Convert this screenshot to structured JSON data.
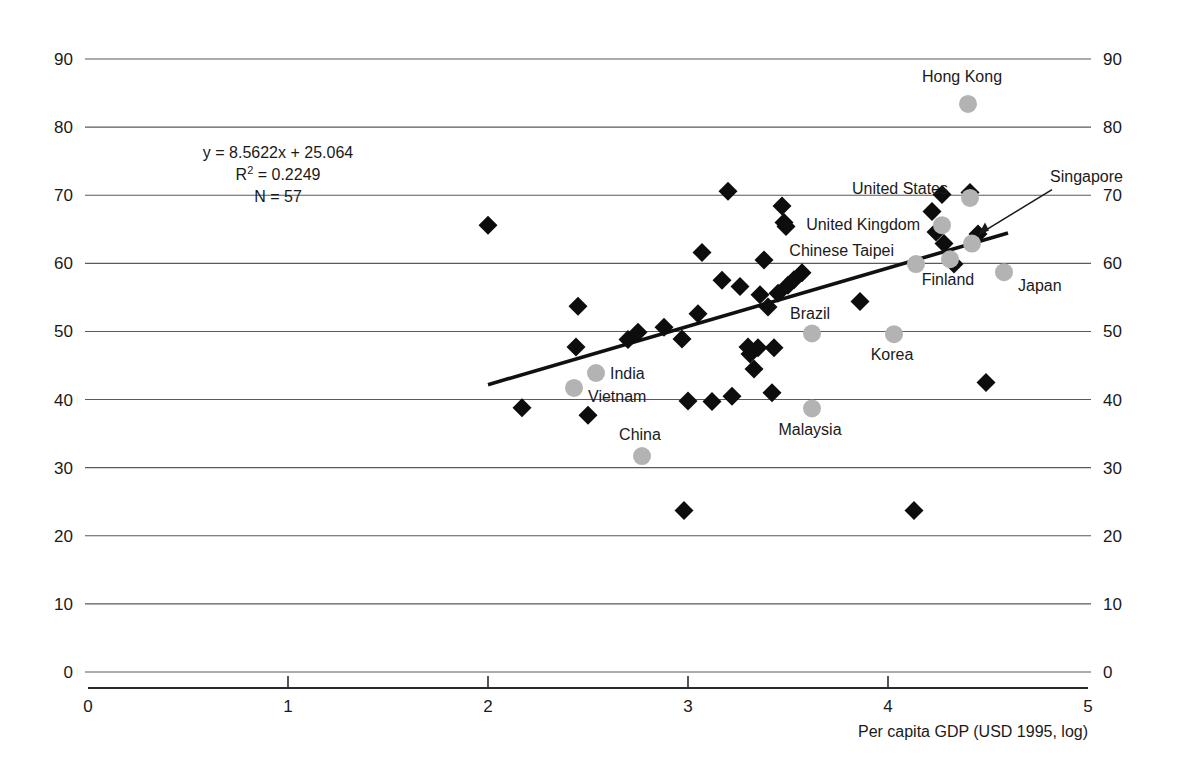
{
  "chart_data": {
    "type": "scatter",
    "title": "",
    "xlabel": "Per capita GDP (USD 1995, log)",
    "ylabel": "",
    "xlim": [
      0,
      5
    ],
    "ylim": [
      0,
      90
    ],
    "xticks": [
      "0",
      "1",
      "2",
      "3",
      "4",
      "5"
    ],
    "yticks": [
      "0",
      "10",
      "20",
      "30",
      "40",
      "50",
      "60",
      "70",
      "80",
      "90"
    ],
    "grid": "horizontal",
    "legend": "none",
    "annotations": {
      "equation": "y = 8.5622x + 25.064",
      "r_squared_prefix": "R",
      "r_squared_sup": "2",
      "r_squared_value": "= 0.2249",
      "n": "N = 57"
    },
    "trendline": {
      "slope": 8.5622,
      "intercept": 25.064,
      "x_start": 2.0,
      "x_end": 4.6
    },
    "series": [
      {
        "name": "labelled-economies",
        "marker": "circle",
        "color": "#b3b3b3",
        "points": [
          {
            "label": "Hong Kong",
            "x": 4.4,
            "y": 83.4,
            "label_dx": -6,
            "label_dy": -22,
            "label_anchor": "middle"
          },
          {
            "label": "United States",
            "x": 4.41,
            "y": 69.6,
            "label_dx": -22,
            "label_dy": -4,
            "label_anchor": "end"
          },
          {
            "label": "Singapore",
            "x": 4.42,
            "y": 62.9,
            "label_dx": 78,
            "label_dy": -62,
            "label_anchor": "start"
          },
          {
            "label": "United Kingdom",
            "x": 4.27,
            "y": 65.6,
            "label_dx": -22,
            "label_dy": 5,
            "label_anchor": "end"
          },
          {
            "label": "Chinese Taipei",
            "x": 4.14,
            "y": 59.9,
            "label_dx": -22,
            "label_dy": -8,
            "label_anchor": "end"
          },
          {
            "label": "Finland",
            "x": 4.31,
            "y": 60.6,
            "label_dx": -2,
            "label_dy": 26,
            "label_anchor": "middle"
          },
          {
            "label": "Japan",
            "x": 4.58,
            "y": 58.7,
            "label_dx": 14,
            "label_dy": 19,
            "label_anchor": "start"
          },
          {
            "label": "Brazil",
            "x": 3.62,
            "y": 49.7,
            "label_dx": -2,
            "label_dy": -14,
            "label_anchor": "middle"
          },
          {
            "label": "Korea",
            "x": 4.03,
            "y": 49.6,
            "label_dx": -2,
            "label_dy": 26,
            "label_anchor": "middle"
          },
          {
            "label": "Malaysia",
            "x": 3.62,
            "y": 38.7,
            "label_dx": -2,
            "label_dy": 27,
            "label_anchor": "middle"
          },
          {
            "label": "India",
            "x": 2.54,
            "y": 43.9,
            "label_dx": 14,
            "label_dy": 6,
            "label_anchor": "start"
          },
          {
            "label": "Vietnam",
            "x": 2.43,
            "y": 41.7,
            "label_dx": 14,
            "label_dy": 14,
            "label_anchor": "start"
          },
          {
            "label": "China",
            "x": 2.77,
            "y": 31.7,
            "label_dx": -2,
            "label_dy": -16,
            "label_anchor": "middle"
          }
        ]
      },
      {
        "name": "other-economies",
        "marker": "diamond",
        "color": "#0d0d0d",
        "points": [
          {
            "x": 2.0,
            "y": 65.6
          },
          {
            "x": 2.17,
            "y": 38.8
          },
          {
            "x": 2.45,
            "y": 53.7
          },
          {
            "x": 2.5,
            "y": 37.7
          },
          {
            "x": 2.44,
            "y": 47.7
          },
          {
            "x": 2.7,
            "y": 48.8
          },
          {
            "x": 2.88,
            "y": 50.6
          },
          {
            "x": 2.97,
            "y": 48.9
          },
          {
            "x": 2.98,
            "y": 23.7
          },
          {
            "x": 3.0,
            "y": 39.8
          },
          {
            "x": 3.07,
            "y": 61.6
          },
          {
            "x": 3.05,
            "y": 52.6
          },
          {
            "x": 3.12,
            "y": 39.7
          },
          {
            "x": 3.2,
            "y": 70.6
          },
          {
            "x": 3.17,
            "y": 57.5
          },
          {
            "x": 3.22,
            "y": 40.5
          },
          {
            "x": 3.26,
            "y": 56.6
          },
          {
            "x": 3.3,
            "y": 47.7
          },
          {
            "x": 3.31,
            "y": 46.7
          },
          {
            "x": 3.33,
            "y": 44.5
          },
          {
            "x": 3.35,
            "y": 47.6
          },
          {
            "x": 3.36,
            "y": 55.4
          },
          {
            "x": 3.38,
            "y": 60.5
          },
          {
            "x": 3.4,
            "y": 53.6
          },
          {
            "x": 3.43,
            "y": 47.6
          },
          {
            "x": 3.45,
            "y": 55.6
          },
          {
            "x": 3.47,
            "y": 68.4
          },
          {
            "x": 3.48,
            "y": 66.0
          },
          {
            "x": 3.49,
            "y": 65.4
          },
          {
            "x": 3.5,
            "y": 56.8
          },
          {
            "x": 3.53,
            "y": 57.6
          },
          {
            "x": 3.57,
            "y": 58.6
          },
          {
            "x": 3.86,
            "y": 54.4
          },
          {
            "x": 4.13,
            "y": 23.7
          },
          {
            "x": 4.22,
            "y": 67.6
          },
          {
            "x": 4.24,
            "y": 64.6
          },
          {
            "x": 4.27,
            "y": 70.1
          },
          {
            "x": 4.28,
            "y": 62.9
          },
          {
            "x": 4.33,
            "y": 59.9
          },
          {
            "x": 4.41,
            "y": 70.4
          },
          {
            "x": 4.45,
            "y": 64.3
          },
          {
            "x": 4.49,
            "y": 42.5
          },
          {
            "x": 3.42,
            "y": 41.0
          },
          {
            "x": 2.75,
            "y": 49.9
          }
        ]
      }
    ]
  }
}
